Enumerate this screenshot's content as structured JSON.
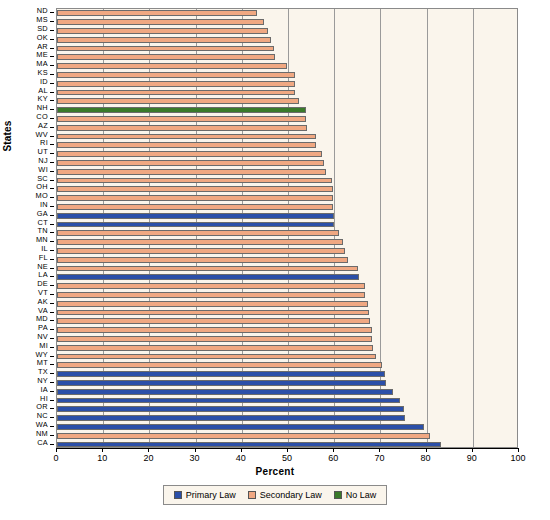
{
  "chart_data": {
    "type": "bar",
    "orientation": "horizontal",
    "title": "",
    "xlabel": "Percent",
    "ylabel": "States",
    "xlim": [
      0,
      100
    ],
    "xticks": [
      0,
      10,
      20,
      30,
      40,
      50,
      60,
      70,
      80,
      90,
      100
    ],
    "grid": true,
    "legend_position": "bottom",
    "legend": [
      {
        "label": "Primary Law",
        "color": "#2b4fa8"
      },
      {
        "label": "Secondary Law",
        "color": "#f0a882"
      },
      {
        "label": "No Law",
        "color": "#3a7a2a"
      }
    ],
    "categories": [
      "ND",
      "MS",
      "SD",
      "OK",
      "AR",
      "ME",
      "MA",
      "KS",
      "ID",
      "AL",
      "KY",
      "NH",
      "CO",
      "AZ",
      "WV",
      "RI",
      "UT",
      "NJ",
      "WI",
      "SC",
      "OH",
      "MO",
      "IN",
      "GA",
      "CT",
      "TN",
      "MN",
      "IL",
      "FL",
      "NE",
      "LA",
      "DE",
      "VT",
      "AK",
      "VA",
      "MD",
      "PA",
      "NV",
      "MI",
      "WY",
      "MT",
      "TX",
      "NY",
      "IA",
      "HI",
      "OR",
      "NC",
      "WA",
      "NM",
      "CA"
    ],
    "values": [
      43.2,
      44.8,
      45.6,
      46.4,
      47.0,
      47.2,
      49.8,
      51.6,
      51.6,
      51.6,
      52.4,
      53.8,
      54.0,
      54.2,
      56.0,
      56.0,
      57.4,
      57.8,
      58.2,
      59.6,
      59.8,
      59.8,
      59.8,
      60.0,
      60.0,
      61.0,
      62.0,
      62.4,
      63.0,
      65.2,
      65.4,
      66.6,
      66.6,
      67.4,
      67.6,
      67.8,
      68.2,
      68.2,
      68.4,
      69.0,
      70.4,
      71.0,
      71.2,
      72.8,
      74.2,
      75.2,
      75.4,
      79.4,
      80.8,
      83.2
    ],
    "series_category": [
      "Secondary Law",
      "Secondary Law",
      "Secondary Law",
      "Secondary Law",
      "Secondary Law",
      "Secondary Law",
      "Secondary Law",
      "Secondary Law",
      "Secondary Law",
      "Secondary Law",
      "Secondary Law",
      "No Law",
      "Secondary Law",
      "Secondary Law",
      "Secondary Law",
      "Secondary Law",
      "Secondary Law",
      "Secondary Law",
      "Secondary Law",
      "Secondary Law",
      "Secondary Law",
      "Secondary Law",
      "Secondary Law",
      "Primary Law",
      "Primary Law",
      "Secondary Law",
      "Secondary Law",
      "Secondary Law",
      "Secondary Law",
      "Secondary Law",
      "Primary Law",
      "Secondary Law",
      "Secondary Law",
      "Secondary Law",
      "Secondary Law",
      "Secondary Law",
      "Secondary Law",
      "Secondary Law",
      "Secondary Law",
      "Secondary Law",
      "Secondary Law",
      "Primary Law",
      "Primary Law",
      "Primary Law",
      "Primary Law",
      "Primary Law",
      "Primary Law",
      "Primary Law",
      "Secondary Law",
      "Primary Law"
    ]
  }
}
